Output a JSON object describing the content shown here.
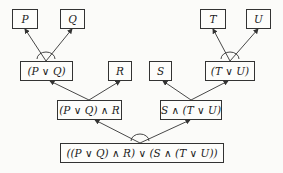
{
  "diagram": {
    "type": "and-or-tree",
    "nodes": [
      {
        "id": "p",
        "label": "P",
        "x": 12,
        "y": 9,
        "w": 26,
        "h": 20
      },
      {
        "id": "q",
        "label": "Q",
        "x": 60,
        "y": 9,
        "w": 25,
        "h": 20
      },
      {
        "id": "t",
        "label": "T",
        "x": 200,
        "y": 9,
        "w": 26,
        "h": 20
      },
      {
        "id": "u",
        "label": "U",
        "x": 246,
        "y": 9,
        "w": 25,
        "h": 20
      },
      {
        "id": "pq",
        "label": "(P ∨ Q)",
        "x": 20,
        "y": 61,
        "w": 53,
        "h": 20
      },
      {
        "id": "r",
        "label": "R",
        "x": 108,
        "y": 61,
        "w": 24,
        "h": 20
      },
      {
        "id": "s",
        "label": "S",
        "x": 149,
        "y": 61,
        "w": 23,
        "h": 20
      },
      {
        "id": "tu",
        "label": "(T ∨ U)",
        "x": 205,
        "y": 61,
        "w": 50,
        "h": 20
      },
      {
        "id": "pqr",
        "label": "(P ∨ Q) ∧ R",
        "x": 57,
        "y": 100,
        "w": 65,
        "h": 20
      },
      {
        "id": "stu",
        "label": "S ∧ (T ∨ U)",
        "x": 160,
        "y": 100,
        "w": 62,
        "h": 20
      },
      {
        "id": "root",
        "label": "((P ∨ Q) ∧ R) ∨ (S ∧ (T ∨ U))",
        "x": 60,
        "y": 143,
        "w": 164,
        "h": 20
      }
    ],
    "edges": [
      {
        "from": [
          46,
          61
        ],
        "to": [
          25,
          29
        ]
      },
      {
        "from": [
          46,
          61
        ],
        "to": [
          72,
          29
        ]
      },
      {
        "from": [
          230,
          61
        ],
        "to": [
          213,
          29
        ]
      },
      {
        "from": [
          230,
          61
        ],
        "to": [
          258,
          29
        ]
      },
      {
        "from": [
          89,
          100
        ],
        "to": [
          50,
          81
        ]
      },
      {
        "from": [
          89,
          100
        ],
        "to": [
          120,
          81
        ]
      },
      {
        "from": [
          191,
          100
        ],
        "to": [
          163,
          81
        ]
      },
      {
        "from": [
          191,
          100
        ],
        "to": [
          228,
          81
        ]
      },
      {
        "from": [
          140,
          143
        ],
        "to": [
          95,
          120
        ]
      },
      {
        "from": [
          140,
          143
        ],
        "to": [
          190,
          120
        ]
      }
    ],
    "arcs": [
      {
        "cx": 46,
        "cy": 61,
        "r": 9
      },
      {
        "cx": 230,
        "cy": 61,
        "r": 9
      },
      {
        "cx": 140,
        "cy": 143,
        "r": 9
      }
    ],
    "colors": {
      "line": "#333333",
      "background": "#fbfbf9"
    }
  }
}
